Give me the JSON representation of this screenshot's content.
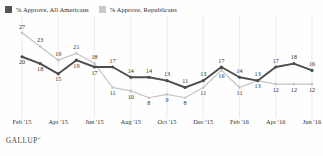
{
  "legend": {
    "items": [
      {
        "label": "% Approve, All Americans",
        "color": "#555555",
        "icon": "square-swatch-dark"
      },
      {
        "label": "% Approve, Republicans",
        "color": "#c9c9c9",
        "icon": "square-swatch-light"
      }
    ]
  },
  "footer": {
    "brand": "GALLUP",
    "mark": "®"
  },
  "chart_data": {
    "type": "line",
    "title": "",
    "subtitle": "",
    "xlabel": "",
    "ylabel": "",
    "grid": "vertical-only",
    "legend_position": "top-left",
    "ylim": [
      5,
      29
    ],
    "x": [
      "Feb '15",
      "Mar '15",
      "Apr '15",
      "May '15",
      "Jun '15",
      "Jul '15",
      "Aug '15",
      "Sep '15",
      "Oct '15",
      "Nov '15",
      "Dec '15",
      "Jan '16",
      "Feb '16",
      "Mar '16",
      "Apr '16",
      "May '16",
      "Jun '16"
    ],
    "tick_labels": [
      "Feb '15",
      "Apr '15",
      "Jun '15",
      "Aug '15",
      "Oct '15",
      "Dec '15",
      "Feb '16",
      "Apr '16",
      "Jun '16"
    ],
    "tick_indices": [
      0,
      2,
      4,
      6,
      8,
      10,
      12,
      14,
      16
    ],
    "series": [
      {
        "name": "% Approve, All Americans",
        "color": "#4d4d4d",
        "values": [
          20,
          18,
          15,
          19,
          17,
          17,
          14,
          14,
          13,
          11,
          13,
          17,
          14,
          13,
          17,
          18,
          16
        ]
      },
      {
        "name": "% Approve, Republicans",
        "color": "#c4c4c4",
        "values": [
          27,
          23,
          19,
          21,
          18,
          11,
          10,
          8,
          9,
          8,
          11,
          16,
          11,
          13,
          12,
          12,
          12
        ]
      }
    ]
  }
}
